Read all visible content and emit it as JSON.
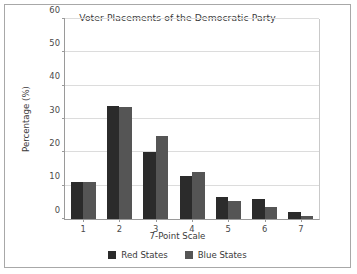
{
  "chart_data": {
    "type": "bar",
    "title": "Voter Placements of the Democratic Party",
    "xlabel": "7-Point Scale",
    "ylabel": "Percentage (%)",
    "categories": [
      "1",
      "2",
      "3",
      "4",
      "5",
      "6",
      "7"
    ],
    "series": [
      {
        "name": "Red States",
        "color": "#2b2b2b",
        "values": [
          11,
          34,
          20,
          13,
          6.5,
          6,
          2
        ]
      },
      {
        "name": "Blue States",
        "color": "#555555",
        "values": [
          11,
          33.5,
          25,
          14,
          5.5,
          3.5,
          1
        ]
      }
    ],
    "ylim": [
      0,
      60
    ],
    "yticks": [
      0,
      10,
      20,
      30,
      40,
      50,
      60
    ],
    "ytick_labels": [
      "0",
      "10",
      "20",
      "30",
      "40",
      "50",
      "60"
    ],
    "grid": "horizontal",
    "legend_position": "bottom-center"
  }
}
